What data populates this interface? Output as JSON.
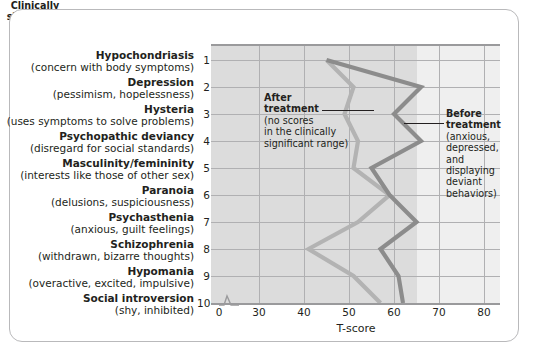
{
  "chart_data": {
    "type": "line",
    "title": "",
    "orientation": "horizontal",
    "xlabel": "T-score",
    "ylabel": "",
    "xlim": [
      30,
      85
    ],
    "axis_break": true,
    "axis_break_note": "axis broken between 0 and 30",
    "xticks": [
      0,
      30,
      40,
      50,
      60,
      70,
      80
    ],
    "xtick_labels": [
      "0",
      "30",
      "40",
      "50",
      "60",
      "70",
      "80"
    ],
    "grid": true,
    "legend_position": "annotations-inline",
    "categories": [
      "Hypochondriasis",
      "Depression",
      "Hysteria",
      "Psychopathic deviancy",
      "Masculinity/femininity",
      "Paranoia",
      "Psychasthenia",
      "Schizophrenia",
      "Hypomania",
      "Social introversion"
    ],
    "category_numbers": [
      "1",
      "2",
      "3",
      "4",
      "5",
      "6",
      "7",
      "8",
      "9",
      "10"
    ],
    "category_descriptions": [
      "(concern with body symptoms)",
      "(pessimism, hopelessness)",
      "(uses symptoms to solve problems)",
      "(disregard for social standards)",
      "(interests like those of other sex)",
      "(delusions, suspiciousness)",
      "(anxious, guilt feelings)",
      "(withdrawn, bizarre thoughts)",
      "(overactive, excited, impulsive)",
      "(shy, inhibited)"
    ],
    "series": [
      {
        "name": "Before treatment",
        "color": "#8c8c8c",
        "values": [
          45,
          66,
          60,
          66,
          55,
          59,
          65,
          57,
          61,
          62
        ]
      },
      {
        "name": "After treatment",
        "color": "#b3b3b3",
        "values": [
          45,
          51,
          49,
          52,
          51,
          59,
          52,
          41,
          51,
          57
        ]
      }
    ],
    "shaded_region": {
      "label": "Clinically significant range",
      "x_start": 65,
      "x_end": 85,
      "color": "#efefef"
    },
    "annotations": [
      {
        "id": "after-treatment",
        "title": "After treatment",
        "body_lines": [
          "(no scores",
          "in the clinically",
          "significant range)"
        ]
      },
      {
        "id": "before-treatment",
        "title": "Before treatment",
        "body_lines": [
          "(anxious,",
          "depressed,",
          "and displaying",
          "deviant",
          "behaviors)"
        ]
      },
      {
        "id": "clinically-significant-range",
        "lines": [
          "Clinically",
          "significant",
          "range"
        ]
      }
    ]
  },
  "colors": {
    "plot_background": "#dcdcdc",
    "band_background": "#efefef",
    "gridline": "#b0b0b2",
    "axis": "#9a9a9c",
    "text": "#231f20",
    "series_before": "#8c8c8c",
    "series_after": "#b3b3b3",
    "frame_border": "#b9b9bb"
  }
}
